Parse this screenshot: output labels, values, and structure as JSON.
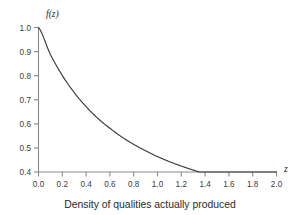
{
  "chart_data": {
    "type": "line",
    "title": "",
    "subtitle": "",
    "caption": "Density of qualities actually produced",
    "xlabel": "z",
    "ylabel": "f(z)",
    "xlim": [
      0.0,
      2.0
    ],
    "ylim": [
      0.33,
      1.0
    ],
    "grid": false,
    "legend": null,
    "x_ticks": [
      "0.0",
      "0.2",
      "0.4",
      "0.6",
      "0.8",
      "1.0",
      "1.2",
      "1.4",
      "1.6",
      "1.8",
      "2.0"
    ],
    "x_tick_values": [
      0.0,
      0.2,
      0.4,
      0.6,
      0.8,
      1.0,
      1.2,
      1.4,
      1.6,
      1.8,
      2.0
    ],
    "y_ticks": [
      "1.0",
      "0.9",
      "0.8",
      "0.7",
      "0.6",
      "0.5",
      "0.4"
    ],
    "y_tick_values": [
      1.0,
      0.9,
      0.8,
      0.7,
      0.6,
      0.5,
      0.4
    ],
    "series": [
      {
        "name": "f(z)",
        "color": "#3a3a3a",
        "x": [
          0.0,
          0.1,
          0.2,
          0.3,
          0.4,
          0.5,
          0.6,
          0.7,
          0.8,
          0.9,
          1.0,
          1.1,
          1.2,
          1.3,
          1.4,
          1.5,
          1.6,
          1.7,
          1.8,
          1.9,
          2.0
        ],
        "values": [
          1.0,
          0.866,
          0.761,
          0.676,
          0.606,
          0.547,
          0.498,
          0.455,
          0.418,
          0.386,
          0.357,
          0.332,
          0.31,
          0.29,
          0.272,
          0.256,
          0.241,
          0.228,
          0.216,
          0.205,
          0.195
        ]
      }
    ]
  },
  "axis": {
    "y_label": "f(z)",
    "x_label": "z"
  },
  "caption": {
    "text": "Density of qualities actually produced"
  },
  "colors": {
    "curve": "#3a3a3a",
    "axis": "#8a8a8a",
    "tick_text": "#3b3b3b",
    "background": "#ffffff"
  }
}
